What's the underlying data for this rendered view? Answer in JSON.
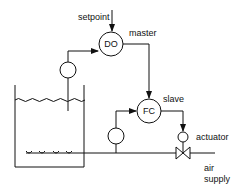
{
  "diagram": {
    "labels": {
      "setpoint": "setpoint",
      "master": "master",
      "slave": "slave",
      "actuator": "actuator",
      "air_line1": "air",
      "air_line2": "supply"
    },
    "controllers": [
      {
        "id": "do",
        "label": "DO",
        "role": "master"
      },
      {
        "id": "fc",
        "label": "FC",
        "role": "slave"
      }
    ],
    "sensors": [
      {
        "id": "do-sensor",
        "measures": "dissolved oxygen in tank"
      },
      {
        "id": "flow-sensor",
        "measures": "air flow in supply line"
      }
    ],
    "components": [
      "aeration tank",
      "diffusers",
      "air supply pipe",
      "control valve",
      "actuator"
    ],
    "connections": [
      {
        "from": "setpoint",
        "to": "DO"
      },
      {
        "from": "do-sensor",
        "to": "DO"
      },
      {
        "from": "DO",
        "to": "FC"
      },
      {
        "from": "flow-sensor",
        "to": "FC"
      },
      {
        "from": "FC",
        "to": "actuator"
      }
    ],
    "colors": {
      "line": "#111111",
      "background": "#ffffff"
    }
  }
}
